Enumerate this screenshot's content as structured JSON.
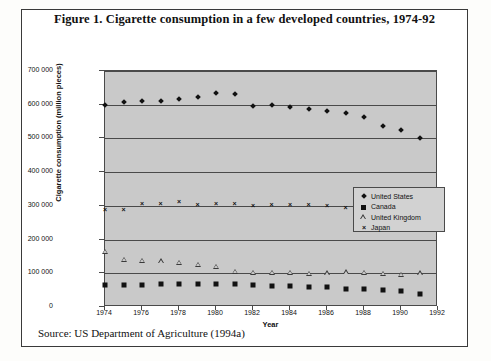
{
  "figure": {
    "title": "Figure 1. Cigarette consumption in a few developed countries, 1974-92",
    "source": "Source: US Department of Agriculture (1994a)"
  },
  "legend": {
    "items": [
      {
        "label": "United States",
        "marker": "diamond-marker"
      },
      {
        "label": "Canada",
        "marker": "square-marker"
      },
      {
        "label": "United Kingdom",
        "marker": "triangle-marker"
      },
      {
        "label": "Japan",
        "marker": "cross-marker"
      }
    ]
  },
  "axes": {
    "y_ticks": [
      "0",
      "100 000",
      "200 000",
      "300 000",
      "400 000",
      "500 000",
      "600 000",
      "700 000"
    ],
    "x_ticks": [
      "1974",
      "1976",
      "1978",
      "1980",
      "1982",
      "1984",
      "1986",
      "1988",
      "1990",
      "1992"
    ],
    "ylabel": "Cigarette consumption (million pieces)",
    "xlabel": "Year"
  },
  "chart_data": {
    "type": "scatter",
    "title": "Figure 1. Cigarette consumption in a few developed countries, 1974-92",
    "xlabel": "Year",
    "ylabel": "Cigarette consumption (million pieces)",
    "xlim": [
      1974,
      1992
    ],
    "ylim": [
      0,
      700000
    ],
    "ytick_step": 100000,
    "xtick_step": 2,
    "grid": "horizontal",
    "legend_position": "center-right-inside",
    "source": "Source: US Department of Agriculture (1994a)",
    "x": [
      1974,
      1975,
      1976,
      1977,
      1978,
      1979,
      1980,
      1981,
      1982,
      1983,
      1984,
      1985,
      1986,
      1987,
      1988,
      1989,
      1990,
      1991
    ],
    "series": [
      {
        "name": "United States",
        "marker": "diamond",
        "values": [
          600000,
          607000,
          610000,
          611000,
          616000,
          622000,
          635000,
          632000,
          596000,
          600000,
          592000,
          587000,
          580000,
          574000,
          563000,
          536000,
          525000,
          500000
        ]
      },
      {
        "name": "Canada",
        "marker": "square",
        "values": [
          64000,
          65000,
          66000,
          67000,
          68000,
          68000,
          69000,
          68000,
          66000,
          62000,
          61000,
          60000,
          58000,
          54000,
          52000,
          50000,
          48000,
          40000
        ]
      },
      {
        "name": "United Kingdom",
        "marker": "triangle",
        "values": [
          164000,
          140000,
          137000,
          136000,
          131000,
          126000,
          119000,
          104000,
          101000,
          101000,
          101000,
          99000,
          100000,
          103000,
          101000,
          98000,
          96000,
          100000
        ]
      },
      {
        "name": "Japan",
        "marker": "cross",
        "values": [
          289000,
          289000,
          306000,
          306000,
          311000,
          303000,
          305000,
          305000,
          301000,
          303000,
          303000,
          303000,
          300000,
          295000,
          294000,
          304000,
          310000,
          316000
        ]
      }
    ]
  }
}
